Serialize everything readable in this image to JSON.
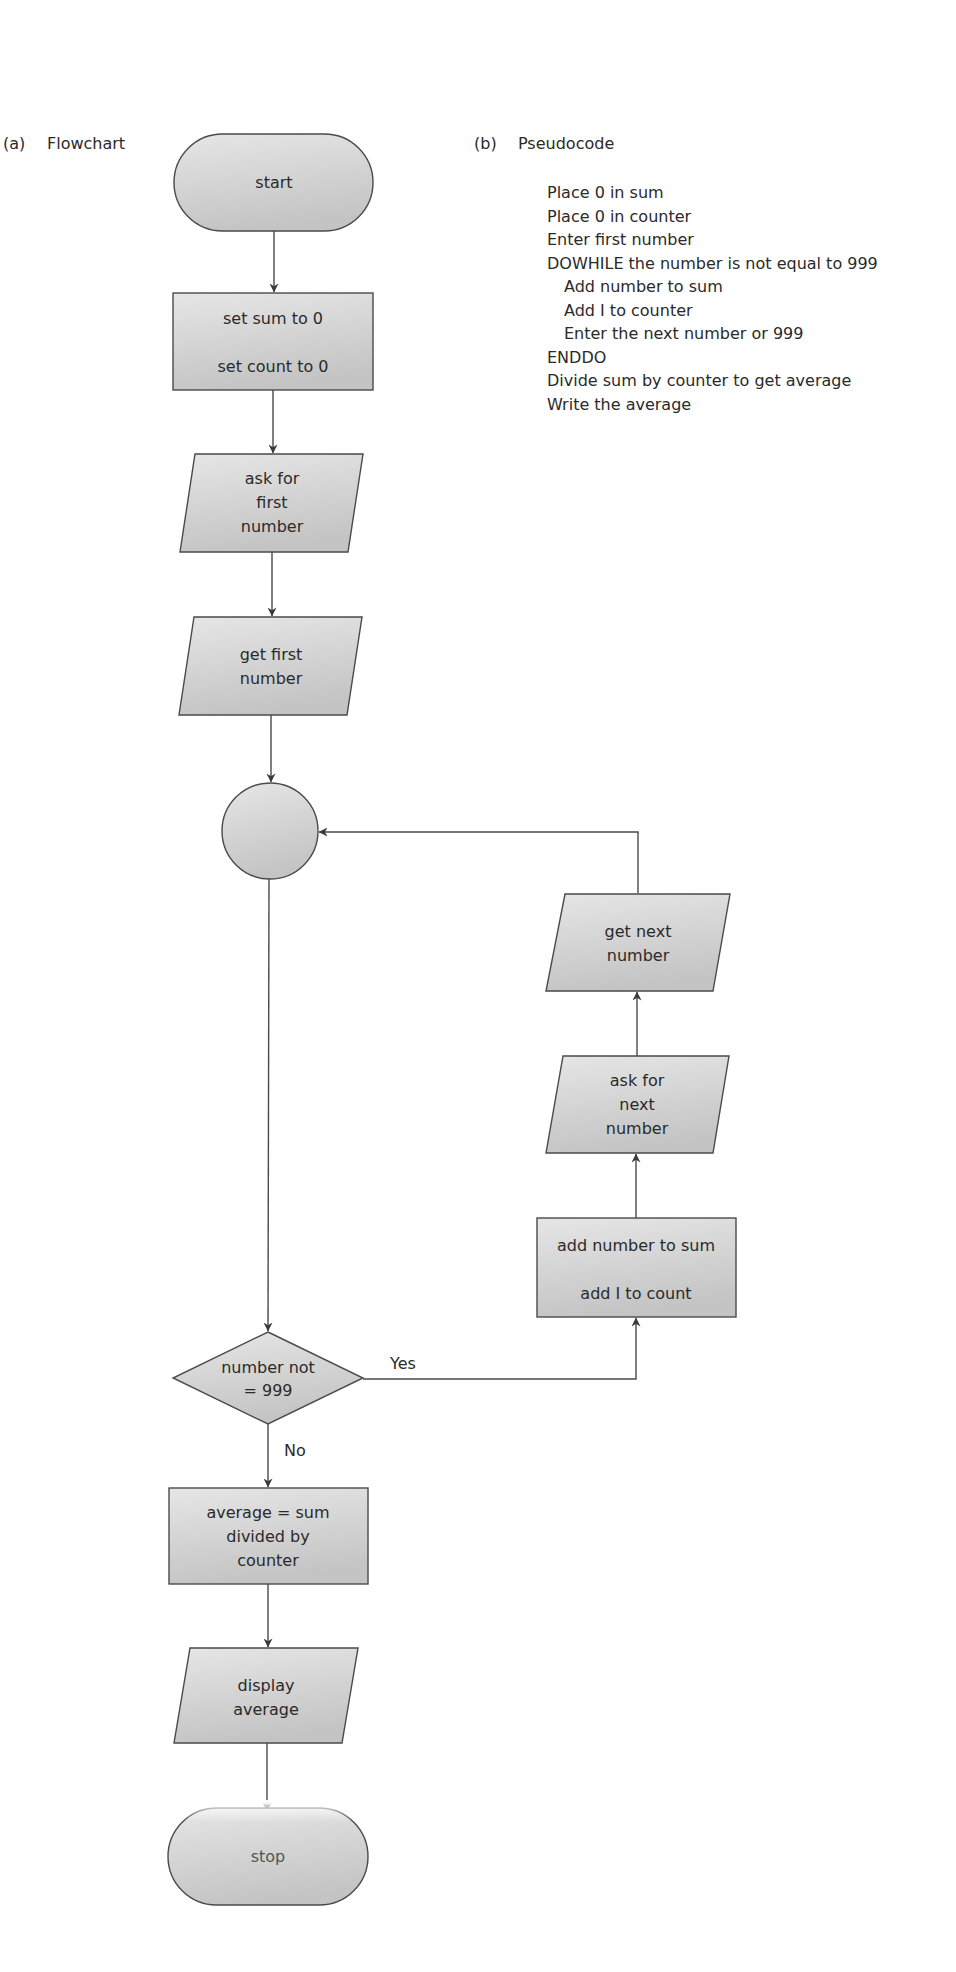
{
  "panels": {
    "a": {
      "tag": "(a)",
      "title": "Flowchart"
    },
    "b": {
      "tag": "(b)",
      "title": "Pseudocode"
    }
  },
  "pseudocode": {
    "lines": [
      {
        "text": "Place 0 in sum",
        "indent": 0
      },
      {
        "text": "Place 0 in counter",
        "indent": 0
      },
      {
        "text": "Enter first number",
        "indent": 0
      },
      {
        "text": "DOWHILE the number is not equal to 999",
        "indent": 0
      },
      {
        "text": "Add number to sum",
        "indent": 1
      },
      {
        "text": "Add I to counter",
        "indent": 1
      },
      {
        "text": "Enter the next number or 999",
        "indent": 1
      },
      {
        "text": "ENDDO",
        "indent": 0
      },
      {
        "text": "Divide sum by counter to get average",
        "indent": 0
      },
      {
        "text": "Write the average",
        "indent": 0
      }
    ]
  },
  "flowchart": {
    "colors": {
      "fill_top": "#e4e4e4",
      "fill_bottom": "#c6c6c6",
      "stroke": "#4a4a4a",
      "text": "#2a2a2a"
    },
    "nodes": {
      "start": {
        "type": "terminator",
        "lines": [
          "start"
        ]
      },
      "init": {
        "type": "process",
        "lines": [
          "set sum to 0",
          "set count to 0"
        ]
      },
      "ask_first": {
        "type": "input",
        "lines": [
          "ask for",
          "first",
          "number"
        ]
      },
      "get_first": {
        "type": "input",
        "lines": [
          "get first",
          "number"
        ]
      },
      "connector": {
        "type": "connector",
        "lines": []
      },
      "decision": {
        "type": "decision",
        "lines": [
          "number not",
          "= 999"
        ]
      },
      "add": {
        "type": "process",
        "lines": [
          "add number to sum",
          "add I to count"
        ]
      },
      "ask_next": {
        "type": "input",
        "lines": [
          "ask for",
          "next",
          "number"
        ]
      },
      "get_next": {
        "type": "input",
        "lines": [
          "get next",
          "number"
        ]
      },
      "average": {
        "type": "process",
        "lines": [
          "average = sum",
          "divided by",
          "counter"
        ]
      },
      "display": {
        "type": "input",
        "lines": [
          "display",
          "average"
        ]
      },
      "stop": {
        "type": "terminator",
        "lines": [
          "stop"
        ]
      }
    },
    "edge_labels": {
      "yes": "Yes",
      "no": "No"
    }
  }
}
